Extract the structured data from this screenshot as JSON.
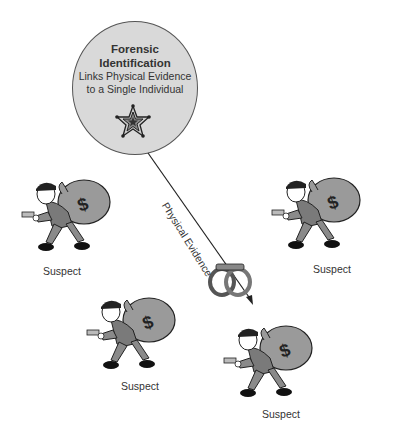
{
  "diagram": {
    "hub": {
      "title_line1": "Forensic",
      "title_line2": "Identification",
      "subtitle_line1": "Links Physical Evidence",
      "subtitle_line2": "to a Single Individual",
      "icon": "sheriff-star-badge-icon"
    },
    "arrow": {
      "label": "Physical Evidence",
      "icon": "handcuffs-icon"
    },
    "suspects": [
      {
        "label": "Suspect",
        "icon": "robber-with-money-bag-icon"
      },
      {
        "label": "Suspect",
        "icon": "robber-with-money-bag-icon"
      },
      {
        "label": "Suspect",
        "icon": "robber-with-money-bag-icon"
      },
      {
        "label": "Suspect",
        "icon": "robber-with-money-bag-icon"
      }
    ],
    "colors": {
      "circle_fill": "#d9d9d9",
      "outline": "#333333",
      "bag": "#9a9a9a",
      "clothes": "#8a8a8a"
    }
  }
}
